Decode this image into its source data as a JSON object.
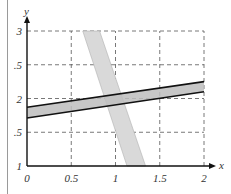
{
  "chart_data": {
    "type": "line",
    "title": "",
    "xlabel": "x",
    "ylabel": "y",
    "xlim": [
      0,
      2
    ],
    "ylim": [
      1,
      3
    ],
    "grid": true,
    "grid_style": "dashed",
    "x_ticks": [
      {
        "value": 0,
        "label": "0"
      },
      {
        "value": 0.5,
        "label": "0.5"
      },
      {
        "value": 1,
        "label": "1"
      },
      {
        "value": 1.5,
        "label": "1.5"
      },
      {
        "value": 2,
        "label": "2"
      }
    ],
    "y_ticks": [
      {
        "value": 1,
        "label": "1"
      },
      {
        "value": 1.5,
        "label": ".5"
      },
      {
        "value": 2,
        "label": "2"
      },
      {
        "value": 2.5,
        "label": ".5"
      },
      {
        "value": 3,
        "label": "3"
      }
    ],
    "series": [
      {
        "name": "shallow-band",
        "kind": "band",
        "fill": "#bdbdbd",
        "edge_color": "#111111",
        "upper": {
          "x": [
            0,
            2
          ],
          "y": [
            1.87,
            2.25
          ]
        },
        "lower": {
          "x": [
            0,
            2
          ],
          "y": [
            1.71,
            2.1
          ]
        }
      },
      {
        "name": "steep-band",
        "kind": "band",
        "fill": "#d9d9d9",
        "edge_color": "#b0b0b0",
        "left": {
          "x": [
            0.63,
            1.13
          ],
          "y": [
            3,
            1
          ]
        },
        "right": {
          "x": [
            0.82,
            1.34
          ],
          "y": [
            3,
            1
          ]
        }
      }
    ]
  },
  "axes": {
    "x_label": "x",
    "y_label": "y"
  }
}
